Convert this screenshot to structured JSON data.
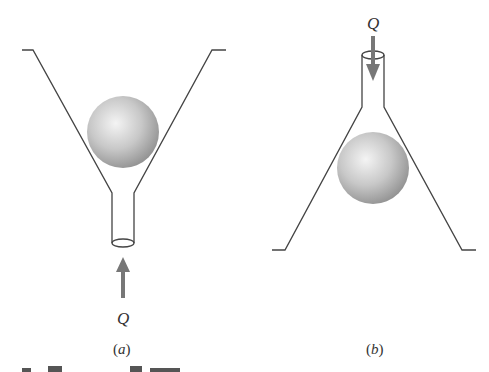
{
  "figure": {
    "panels": [
      {
        "id": "a",
        "label_open": "(",
        "label_letter": "a",
        "label_close": ")",
        "flow_label": "Q",
        "flow_direction": "up",
        "description": "Inverted funnel (wide top, narrow tube bottom) with sphere suspended; flow Q enters from bottom"
      },
      {
        "id": "b",
        "label_open": "(",
        "label_letter": "b",
        "label_close": ")",
        "flow_label": "Q",
        "flow_direction": "down",
        "description": "Funnel with narrow tube at top, wide base at bottom, sphere suspended; flow Q enters from top"
      }
    ],
    "colors": {
      "line": "#444444",
      "sphere_light": "#f2f2f2",
      "sphere_dark": "#9a9a9a",
      "arrow": "#777777",
      "text": "#333333"
    }
  }
}
